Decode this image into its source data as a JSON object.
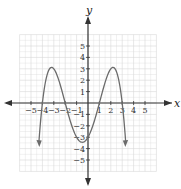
{
  "chart_data": {
    "type": "line",
    "title": "",
    "xlabel": "x",
    "ylabel": "y",
    "xlim": [
      -6,
      6
    ],
    "ylim": [
      -6,
      6
    ],
    "grid": true,
    "x_ticks": [
      -5,
      -4,
      -3,
      -2,
      -1,
      1,
      2,
      3,
      4,
      5
    ],
    "y_ticks": [
      -5,
      -4,
      -3,
      -2,
      -1,
      1,
      2,
      3,
      4,
      5
    ],
    "x_tick_labels": [
      "−5",
      "−4",
      "−3",
      "−2",
      "−1",
      "1",
      "2",
      "3",
      "4",
      "5"
    ],
    "y_tick_labels": [
      "−5",
      "−4",
      "−3",
      "−2",
      "−1",
      "1",
      "2",
      "3",
      "4",
      "5"
    ],
    "series": [
      {
        "name": "f(x)",
        "description": "Degree-4 polynomial with negative leading coefficient, f(x) = -0.125(x+4)(x+2)(x-1)(x-3)",
        "zeros": [
          -4,
          -2,
          1,
          3
        ],
        "local_maxima": [
          [
            -3,
            3
          ],
          [
            2,
            3
          ]
        ],
        "local_minimum": [
          -0.5,
          -3.45
        ],
        "y_intercept": -3,
        "end_behavior": "both ends point down (arrows)",
        "x": [
          -4.3,
          -4,
          -3.5,
          -3,
          -2.5,
          -2,
          -1.5,
          -1,
          -0.5,
          0,
          0.5,
          1,
          1.5,
          2,
          2.5,
          3,
          3.3
        ],
        "y": [
          -4.8,
          0,
          2.3,
          3,
          2.3,
          0,
          -2.0,
          -3.0,
          -3.45,
          -3,
          -1.9,
          0,
          1.8,
          3,
          2.9,
          0,
          -4.9
        ]
      }
    ]
  },
  "colors": {
    "curve": "#6b6b6b",
    "axes": "#333333",
    "grid": "#d6d6d6"
  }
}
